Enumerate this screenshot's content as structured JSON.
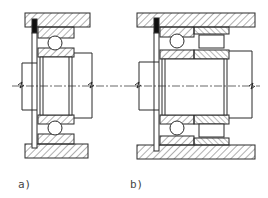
{
  "figure": {
    "panels": [
      {
        "id": "a",
        "label": "a)",
        "description": "single-row deep groove ball bearing with retaining ring in housing bore"
      },
      {
        "id": "b",
        "label": "b)",
        "description": "ball bearing combined with roller bearing row and retaining ring in housing bore"
      }
    ],
    "colors": {
      "line": "#2a2a2a",
      "hatch": "#3a3a3a",
      "background": "#ffffff"
    }
  }
}
